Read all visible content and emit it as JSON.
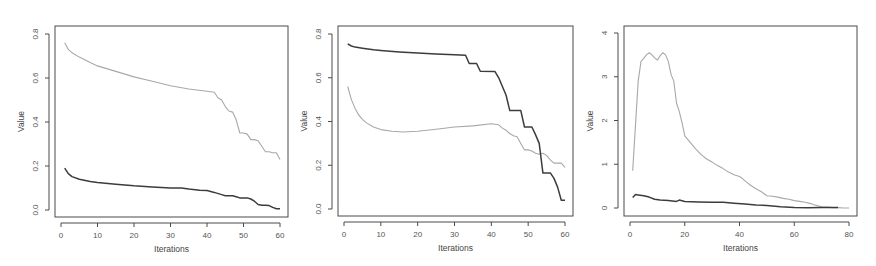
{
  "chart_data": [
    {
      "type": "line",
      "title": "",
      "xlabel": "Iterations",
      "ylabel": "Value",
      "xlim": [
        0,
        60
      ],
      "ylim": [
        0.0,
        0.8
      ],
      "xticks": [
        0,
        10,
        20,
        30,
        40,
        50,
        60
      ],
      "yticks": [
        "0.0",
        "0.2",
        "0.4",
        "0.6",
        "0.8"
      ],
      "grid": false,
      "legend": null,
      "series": [
        {
          "name": "light",
          "color": "#a8a8a8",
          "width": 1.1,
          "x": [
            1,
            2,
            3,
            5,
            8,
            10,
            15,
            20,
            25,
            30,
            35,
            40,
            42,
            43,
            44,
            45,
            46,
            47,
            48,
            49,
            50,
            51,
            52,
            53,
            54,
            55,
            56,
            57,
            58,
            59,
            60
          ],
          "y": [
            0.76,
            0.73,
            0.715,
            0.695,
            0.67,
            0.655,
            0.63,
            0.605,
            0.585,
            0.565,
            0.55,
            0.54,
            0.535,
            0.51,
            0.5,
            0.47,
            0.45,
            0.445,
            0.41,
            0.35,
            0.35,
            0.345,
            0.32,
            0.32,
            0.315,
            0.29,
            0.265,
            0.265,
            0.26,
            0.26,
            0.23
          ]
        },
        {
          "name": "dark",
          "color": "#3c3c3c",
          "width": 1.5,
          "x": [
            1,
            2,
            3,
            5,
            8,
            10,
            15,
            20,
            25,
            30,
            33,
            35,
            38,
            40,
            42,
            44,
            45,
            47,
            48,
            49,
            51,
            52,
            53,
            54,
            55,
            56,
            57,
            58,
            59,
            60
          ],
          "y": [
            0.19,
            0.165,
            0.152,
            0.14,
            0.13,
            0.125,
            0.117,
            0.11,
            0.105,
            0.1,
            0.1,
            0.095,
            0.09,
            0.088,
            0.08,
            0.07,
            0.065,
            0.065,
            0.06,
            0.055,
            0.055,
            0.05,
            0.04,
            0.025,
            0.022,
            0.022,
            0.02,
            0.012,
            0.006,
            0.006
          ]
        }
      ]
    },
    {
      "type": "line",
      "title": "",
      "xlabel": "Iterations",
      "ylabel": "Value",
      "xlim": [
        0,
        60
      ],
      "ylim": [
        0.0,
        0.8
      ],
      "xticks": [
        0,
        10,
        20,
        30,
        40,
        50,
        60
      ],
      "yticks": [
        "0.0",
        "0.2",
        "0.4",
        "0.6",
        "0.8"
      ],
      "grid": false,
      "legend": null,
      "series": [
        {
          "name": "light",
          "color": "#a8a8a8",
          "width": 1.1,
          "x": [
            1,
            2,
            3,
            4,
            5,
            6,
            8,
            10,
            13,
            16,
            20,
            25,
            30,
            35,
            40,
            42,
            43,
            44,
            45,
            46,
            47,
            48,
            49,
            50,
            51,
            52,
            53,
            54,
            55,
            56,
            57,
            58,
            59,
            60
          ],
          "y": [
            0.56,
            0.5,
            0.46,
            0.43,
            0.41,
            0.395,
            0.375,
            0.363,
            0.355,
            0.352,
            0.355,
            0.365,
            0.375,
            0.38,
            0.39,
            0.385,
            0.37,
            0.36,
            0.345,
            0.335,
            0.33,
            0.3,
            0.27,
            0.27,
            0.265,
            0.255,
            0.25,
            0.255,
            0.245,
            0.225,
            0.21,
            0.21,
            0.21,
            0.19
          ]
        },
        {
          "name": "dark",
          "color": "#3c3c3c",
          "width": 1.5,
          "x": [
            1,
            2,
            3,
            5,
            8,
            10,
            15,
            20,
            25,
            30,
            33,
            34,
            36,
            37,
            41,
            42,
            43,
            44,
            45,
            48,
            49,
            51,
            52,
            53,
            54,
            56,
            57,
            58,
            59,
            60
          ],
          "y": [
            0.755,
            0.745,
            0.74,
            0.735,
            0.728,
            0.725,
            0.718,
            0.713,
            0.708,
            0.705,
            0.703,
            0.665,
            0.665,
            0.63,
            0.628,
            0.6,
            0.56,
            0.52,
            0.45,
            0.45,
            0.375,
            0.375,
            0.34,
            0.3,
            0.165,
            0.165,
            0.14,
            0.1,
            0.04,
            0.04
          ]
        }
      ]
    },
    {
      "type": "line",
      "title": "",
      "xlabel": "Iterations",
      "ylabel": "Value",
      "xlim": [
        0,
        80
      ],
      "ylim": [
        0,
        4
      ],
      "xticks": [
        0,
        20,
        40,
        60,
        80
      ],
      "yticks": [
        "0",
        "1",
        "2",
        "3",
        "4"
      ],
      "grid": false,
      "legend": null,
      "series": [
        {
          "name": "light",
          "color": "#a8a8a8",
          "width": 1.1,
          "x": [
            1,
            2,
            3,
            4,
            5,
            6,
            7,
            8,
            9,
            10,
            11,
            12,
            13,
            14,
            15,
            16,
            17,
            18,
            19,
            20,
            22,
            24,
            26,
            28,
            30,
            32,
            34,
            36,
            38,
            40,
            41,
            42,
            44,
            46,
            48,
            50,
            52,
            54,
            56,
            58,
            60,
            62,
            64,
            66,
            68,
            70,
            72,
            74,
            76,
            78,
            80
          ],
          "y": [
            0.85,
            1.9,
            2.9,
            3.35,
            3.42,
            3.5,
            3.55,
            3.5,
            3.43,
            3.38,
            3.48,
            3.55,
            3.5,
            3.35,
            3.05,
            2.9,
            2.4,
            2.2,
            1.95,
            1.65,
            1.5,
            1.35,
            1.22,
            1.12,
            1.05,
            0.97,
            0.9,
            0.82,
            0.76,
            0.72,
            0.68,
            0.62,
            0.52,
            0.44,
            0.37,
            0.28,
            0.27,
            0.25,
            0.22,
            0.2,
            0.17,
            0.15,
            0.13,
            0.1,
            0.06,
            0.03,
            0.02,
            0.01,
            0.01,
            0.0,
            0.0
          ]
        },
        {
          "name": "dark",
          "color": "#3c3c3c",
          "width": 1.5,
          "x": [
            1,
            2,
            3,
            5,
            7,
            9,
            11,
            14,
            17,
            18,
            20,
            25,
            30,
            34,
            38,
            42,
            46,
            50,
            55,
            60,
            65,
            70,
            73,
            76
          ],
          "y": [
            0.24,
            0.31,
            0.3,
            0.28,
            0.25,
            0.2,
            0.18,
            0.17,
            0.15,
            0.18,
            0.15,
            0.14,
            0.13,
            0.13,
            0.11,
            0.09,
            0.07,
            0.06,
            0.03,
            0.01,
            0.005,
            0.01,
            0.01,
            0.01
          ]
        }
      ]
    }
  ]
}
